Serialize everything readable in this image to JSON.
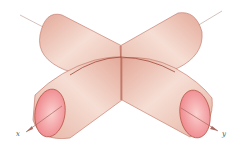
{
  "figure": {
    "axes": {
      "x": {
        "label": "x"
      },
      "y": {
        "label": "y"
      }
    },
    "colors": {
      "cylinder_body": "#e8b5a5",
      "cylinder_highlight": "#f5ddd2",
      "end_cap": "#f08a8e",
      "edge": "#b8584a",
      "axis_line": "#c0a8a0"
    }
  }
}
